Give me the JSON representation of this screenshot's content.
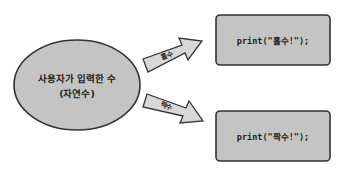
{
  "diagram": {
    "source": {
      "line1": "사용자가 입력한 수",
      "line2": "(자연수)"
    },
    "branches": [
      {
        "label": "홀수",
        "code": "print(\"홀수!\");"
      },
      {
        "label": "짝수",
        "code": "print(\"짝수!\");"
      }
    ],
    "colors": {
      "shape_fill": "#c4c4c4",
      "arrow_fill": "#d8d8d8",
      "stroke": "#333333",
      "background": "#ffffff"
    }
  }
}
